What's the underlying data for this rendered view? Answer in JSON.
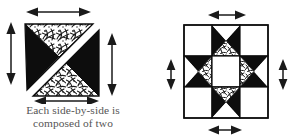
{
  "document": {
    "kind": "quilting-instruction-diagram",
    "background_color": "#ffffff",
    "ink_color": "#1a1a1a",
    "text_color": "#555555"
  },
  "caption": {
    "line1": "Each side-by-side is",
    "line2": "composed of two"
  },
  "figures": [
    {
      "id": "side-by-side-unit",
      "name": "side-by-side-unit-diagram",
      "description": "Square pieced unit split on the diagonal into two half-square triangles, each triangle itself made of a printed fabric triangle and a solid black triangle, separated by a white seam line.",
      "patches": [
        {
          "name": "upper-triangle-print",
          "fabric": "print",
          "position": "upper-left-outer"
        },
        {
          "name": "upper-triangle-solid",
          "fabric": "solid-black",
          "position": "upper-left-inner"
        },
        {
          "name": "lower-triangle-solid",
          "fabric": "solid-black",
          "position": "lower-right-outer"
        },
        {
          "name": "lower-triangle-print",
          "fabric": "print",
          "position": "lower-right-inner"
        }
      ],
      "dimension_arrows": [
        {
          "name": "top-width-arrow",
          "orientation": "horizontal",
          "edge": "top"
        },
        {
          "name": "left-height-arrow",
          "orientation": "vertical",
          "edge": "left"
        },
        {
          "name": "right-height-arrow",
          "orientation": "vertical",
          "edge": "right"
        },
        {
          "name": "bottom-width-arrow",
          "orientation": "horizontal",
          "edge": "bottom"
        }
      ]
    },
    {
      "id": "star-block",
      "name": "eight-pointed-star-block-diagram",
      "description": "Nine-patch eight pointed star block: four plain white corner squares, four hourglass point units with black star points and printed inner triangles, and a plain white center square.",
      "grid": [
        [
          "corner-plain",
          "point-unit-top",
          "corner-plain"
        ],
        [
          "point-unit-left",
          "center-plain",
          "point-unit-right"
        ],
        [
          "corner-plain",
          "point-unit-bottom",
          "corner-plain"
        ]
      ],
      "dimension_arrows": [
        {
          "name": "top-width-arrow",
          "orientation": "horizontal",
          "edge": "top"
        },
        {
          "name": "left-height-arrow",
          "orientation": "vertical",
          "edge": "left"
        },
        {
          "name": "right-height-arrow",
          "orientation": "vertical",
          "edge": "right"
        },
        {
          "name": "bottom-width-arrow",
          "orientation": "horizontal",
          "edge": "bottom"
        }
      ]
    }
  ]
}
